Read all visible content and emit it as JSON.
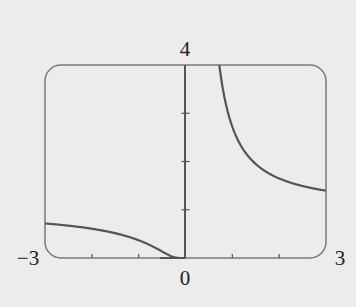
{
  "chart_data": {
    "type": "line",
    "title": "",
    "function": "y = e^(1/x)",
    "xlabel": "",
    "ylabel": "",
    "xlim": [
      -3,
      3
    ],
    "ylim": [
      0,
      4
    ],
    "x_tick_labels": {
      "min": "−3",
      "zero": "0",
      "max": "3"
    },
    "y_tick_labels": {
      "max": "4"
    },
    "x_ticks": [
      -2,
      -1,
      1,
      2
    ],
    "y_ticks": [
      1,
      2,
      3
    ],
    "grid": false,
    "legend": "none",
    "series": [
      {
        "name": "left branch",
        "x": [
          -3,
          -2.5,
          -2,
          -1.5,
          -1,
          -0.75,
          -0.5,
          -0.3,
          -0.2,
          -0.1,
          0
        ],
        "y": [
          0.717,
          0.67,
          0.607,
          0.513,
          0.368,
          0.264,
          0.135,
          0.036,
          0.007,
          0.0,
          0
        ]
      },
      {
        "name": "right branch",
        "x": [
          0.72,
          0.8,
          1,
          1.25,
          1.5,
          2,
          2.5,
          3
        ],
        "y": [
          4.0,
          3.49,
          2.72,
          2.23,
          1.95,
          1.65,
          1.49,
          1.4
        ]
      }
    ]
  },
  "colors": {
    "background": "#ececec",
    "frame": "#777777",
    "curve": "#555555",
    "axis": "#555555"
  }
}
